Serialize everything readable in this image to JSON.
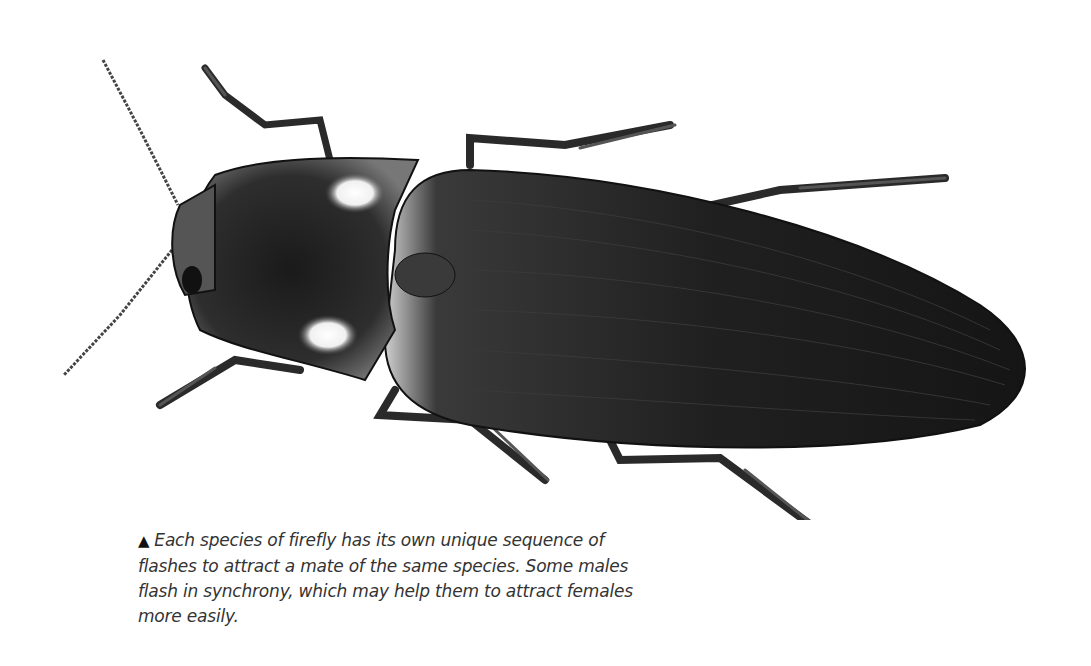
{
  "figure": {
    "caption": {
      "marker": "▲",
      "text": "Each species of firefly has its own unique sequence of flashes to attract a mate of the same species. Some males flash in synchrony, which may help them to attract females more easily."
    }
  },
  "colors": {
    "background": "#ffffff",
    "body": "#1c1c1c",
    "highlight": "#f5f5f5",
    "caption_text": "#333333"
  }
}
